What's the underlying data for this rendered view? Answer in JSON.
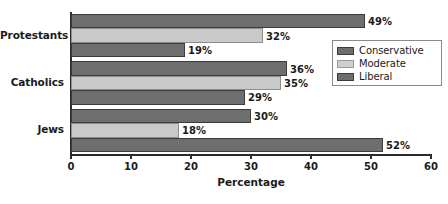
{
  "chart_data": {
    "type": "bar",
    "orientation": "horizontal",
    "title": "",
    "xlabel": "Percentage",
    "ylabel": "",
    "categories": [
      "Protestants",
      "Catholics",
      "Jews"
    ],
    "series": [
      {
        "name": "Conservative",
        "color": "#6e6e6e",
        "values": [
          49,
          36,
          30
        ],
        "labels": [
          "49%",
          "36%",
          "30%"
        ]
      },
      {
        "name": "Moderate",
        "color": "#c9c9c9",
        "values": [
          32,
          35,
          18
        ],
        "labels": [
          "32%",
          "35%",
          "18%"
        ]
      },
      {
        "name": "Liberal",
        "color": "#6e6e6e",
        "values": [
          19,
          29,
          52
        ],
        "labels": [
          "19%",
          "29%",
          "52%"
        ]
      }
    ],
    "xlim": [
      0,
      60
    ],
    "xticks": [
      0,
      10,
      20,
      30,
      40,
      50,
      60
    ],
    "xtick_labels": [
      "0",
      "10",
      "20",
      "30",
      "40",
      "50",
      "60"
    ],
    "grid": false,
    "legend_position": "center-right",
    "value_label_suffix": "%"
  }
}
